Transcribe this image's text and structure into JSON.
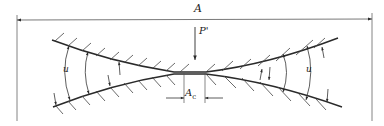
{
  "diagram": {
    "type": "contact-of-curved-surfaces",
    "labels": {
      "overall_dimension": "A",
      "load": "P'",
      "angle_left": "u",
      "angle_right": "u",
      "contact_area_main": "A",
      "contact_area_sub": "c"
    },
    "colors": {
      "line": "#2a2a2a",
      "thin_line": "#555555",
      "background": "#ffffff"
    }
  }
}
